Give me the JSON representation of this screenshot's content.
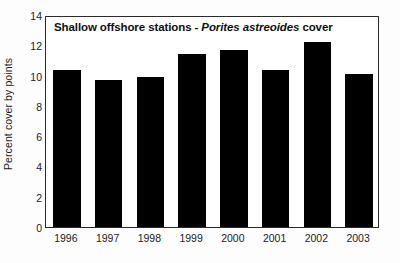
{
  "chart_data": {
    "type": "bar",
    "title_prefix": "Shallow offshore stations - ",
    "title_species": "Porites astreoides",
    "title_suffix": " cover",
    "title": "Shallow offshore stations - Porites astreoides cover",
    "xlabel": "",
    "ylabel": "Percent cover by points",
    "categories": [
      "1996",
      "1997",
      "1998",
      "1999",
      "2000",
      "2001",
      "2002",
      "2003"
    ],
    "values": [
      10.4,
      9.7,
      9.9,
      11.4,
      11.7,
      10.4,
      12.2,
      10.1
    ],
    "ylim": [
      0,
      14
    ],
    "yticks": [
      "0",
      "2",
      "4",
      "6",
      "8",
      "10",
      "12",
      "14"
    ],
    "ytick_values": [
      0,
      2,
      4,
      6,
      8,
      10,
      12,
      14
    ],
    "grid": false,
    "legend": false,
    "bar_color": "#000000",
    "axis_color": "#2b2b2b",
    "background_color": "#ffffff"
  }
}
